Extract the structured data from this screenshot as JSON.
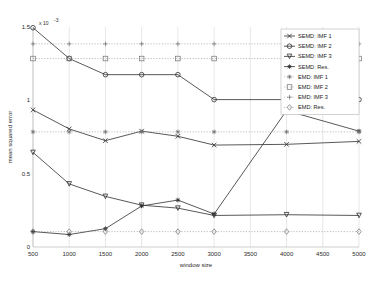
{
  "chart_data": {
    "type": "line",
    "title": "",
    "xlabel": "window size",
    "ylabel": "mean squared error",
    "y_exponent_label": "x 10",
    "y_exponent_sup": "-3",
    "x": [
      500,
      1000,
      1500,
      2000,
      2500,
      3000,
      4000,
      5000
    ],
    "xlim": [
      500,
      5000
    ],
    "ylim": [
      0,
      1.5
    ],
    "xticks": [
      500,
      1000,
      1500,
      2000,
      2500,
      3000,
      3500,
      4000,
      4500,
      5000
    ],
    "xticklabels": [
      "500",
      "1000",
      "1500",
      "2000",
      "2500",
      "3000",
      "3500",
      "4000",
      "4500",
      "5000"
    ],
    "yticks": [
      0,
      0.5,
      1,
      1.5
    ],
    "yticklabels": [
      "0",
      "0.5",
      "1",
      "1.5"
    ],
    "grid": "vertical-dotted",
    "legend_position": "top-right",
    "series": [
      {
        "name": "SEMD: IMF 1",
        "marker": "x",
        "style": "solid",
        "values": [
          0.935,
          0.805,
          0.725,
          0.79,
          0.755,
          0.695,
          0.7,
          0.72
        ]
      },
      {
        "name": "SEMD: IMF 2",
        "marker": "circle",
        "style": "solid",
        "values": [
          1.495,
          1.285,
          1.175,
          1.175,
          1.175,
          1.005,
          1.005,
          1.005
        ]
      },
      {
        "name": "SEMD: IMF 3",
        "marker": "triangle-down",
        "style": "solid",
        "values": [
          0.645,
          0.43,
          0.345,
          0.285,
          0.265,
          0.215,
          0.22,
          0.215
        ]
      },
      {
        "name": "SEMD: Res.",
        "marker": "star",
        "style": "solid",
        "values": [
          0.105,
          0.085,
          0.125,
          0.28,
          0.32,
          0.225,
          0.93,
          0.79
        ]
      },
      {
        "name": "EMD: IMF 1",
        "marker": "star",
        "style": "dotted",
        "values": [
          0.785,
          0.785,
          0.785,
          0.785,
          0.785,
          0.785,
          0.785,
          0.785
        ]
      },
      {
        "name": "EMD: IMF 2",
        "marker": "square",
        "style": "dotted",
        "values": [
          1.285,
          1.285,
          1.285,
          1.285,
          1.285,
          1.285,
          1.285,
          1.285
        ]
      },
      {
        "name": "EMD: IMF 3",
        "marker": "plus",
        "style": "dotted",
        "values": [
          1.385,
          1.385,
          1.385,
          1.385,
          1.385,
          1.385,
          1.385,
          1.385
        ]
      },
      {
        "name": "EMD: Res.",
        "marker": "diamond",
        "style": "dotted",
        "values": [
          0.105,
          0.105,
          0.105,
          0.105,
          0.105,
          0.105,
          0.105,
          0.105
        ]
      }
    ]
  }
}
